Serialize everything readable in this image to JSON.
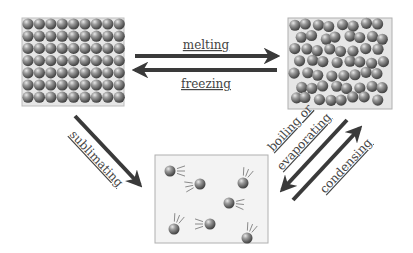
{
  "diagram": {
    "states": [
      {
        "id": "solid",
        "name": "Solid",
        "arrangement": "regular grid",
        "columns": 9,
        "rows": 7
      },
      {
        "id": "liquid",
        "name": "Liquid",
        "arrangement": "close, disordered"
      },
      {
        "id": "gas",
        "name": "Gas",
        "arrangement": "sparse, moving",
        "particles": 8
      }
    ],
    "transitions": [
      {
        "id": "melting",
        "label": "melting",
        "from": "solid",
        "to": "liquid"
      },
      {
        "id": "freezing",
        "label": "freezing",
        "from": "liquid",
        "to": "solid"
      },
      {
        "id": "sublimating",
        "label": "sublimating",
        "from": "solid",
        "to": "gas"
      },
      {
        "id": "boiling",
        "label_line1": "boiling or",
        "label_line2": "evaporating",
        "from": "liquid",
        "to": "gas"
      },
      {
        "id": "condensing",
        "label": "condensing",
        "from": "gas",
        "to": "liquid"
      }
    ],
    "colors": {
      "arrow": "#3a3a3a",
      "box_fill": "#e6e6e6",
      "box_border": "#b0b0b0",
      "particle": "#777777",
      "label": "#444444"
    }
  }
}
